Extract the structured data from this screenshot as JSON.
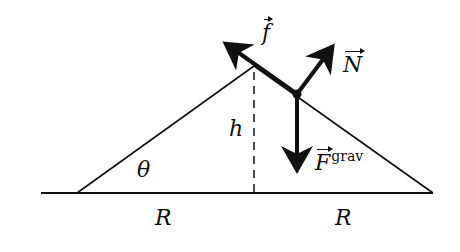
{
  "diagram": {
    "colors": {
      "ink": "#111111",
      "background": "#ffffff"
    },
    "geometry": {
      "baseline": {
        "x1": 41,
        "x2": 433,
        "y": 193
      },
      "triangle": {
        "left": [
          77,
          193
        ],
        "apex": [
          254,
          66
        ],
        "right": [
          433,
          193
        ]
      },
      "height_line": {
        "x": 254,
        "y1": 66,
        "y2": 193,
        "style": "dashed"
      },
      "block_point": [
        297,
        94
      ]
    },
    "forces": [
      {
        "name": "friction",
        "label": "f",
        "vector": true,
        "from": [
          297,
          94
        ],
        "to": [
          223,
          42
        ]
      },
      {
        "name": "normal",
        "label": "N",
        "vector": true,
        "from": [
          297,
          94
        ],
        "to": [
          334,
          44
        ]
      },
      {
        "name": "gravity",
        "label": "F",
        "superscript": "grav",
        "vector": true,
        "from": [
          297,
          94
        ],
        "to": [
          297,
          172
        ]
      }
    ],
    "labels": {
      "f": "f",
      "N": "N",
      "F": "F",
      "F_sup": "grav",
      "h": "h",
      "theta": "θ",
      "R_left": "R",
      "R_right": "R"
    }
  }
}
